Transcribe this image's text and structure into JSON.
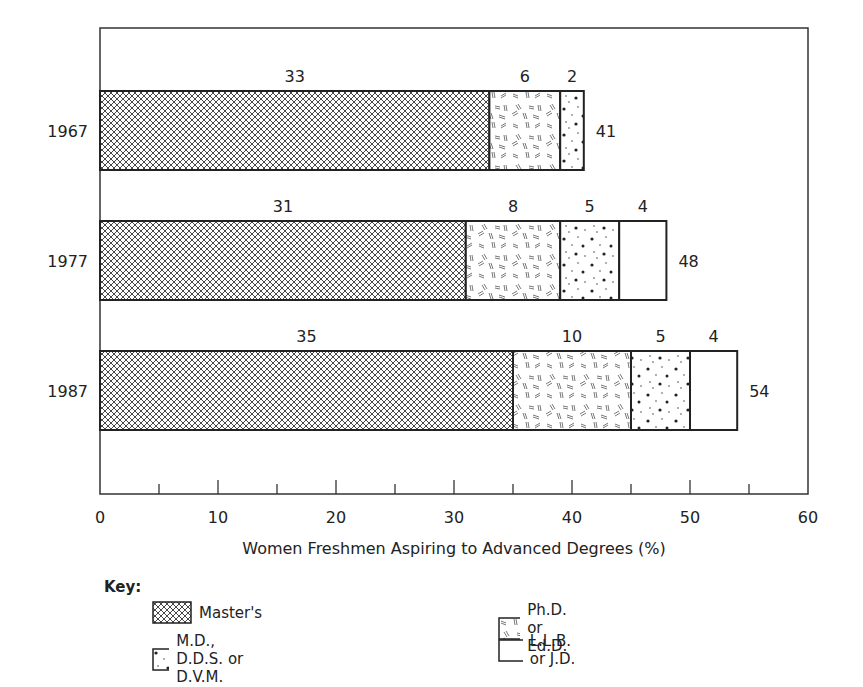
{
  "chart_data": {
    "type": "bar",
    "orientation": "horizontal",
    "stacked": true,
    "title": "",
    "xlabel": "Women Freshmen Aspiring to Advanced Degrees (%)",
    "ylabel": "",
    "xlim": [
      0,
      60
    ],
    "x_ticks": [
      0,
      10,
      20,
      30,
      40,
      50,
      60
    ],
    "x_minor_ticks": [
      5,
      15,
      25,
      35,
      45,
      55
    ],
    "grid": false,
    "categories": [
      "1967",
      "1977",
      "1987"
    ],
    "series": [
      {
        "name": "Master's",
        "pattern": "crosshatch",
        "values": [
          33,
          31,
          35
        ]
      },
      {
        "name": "Ph.D. or Ed.D.",
        "pattern": "dashes",
        "values": [
          6,
          8,
          10
        ]
      },
      {
        "name": "M.D., D.D.S. or D.V.M.",
        "pattern": "dots",
        "values": [
          2,
          5,
          5
        ]
      },
      {
        "name": "L.L.B. or J.D.",
        "pattern": "blank",
        "values": [
          0,
          4,
          4
        ]
      }
    ],
    "totals": [
      41,
      48,
      54
    ],
    "legend_position": "bottom",
    "legend_title": "Key:"
  },
  "legend": {
    "title": "Key:",
    "items": [
      {
        "label": "Master's",
        "pattern": "crosshatch"
      },
      {
        "label": "M.D., D.D.S. or D.V.M.",
        "pattern": "dots"
      },
      {
        "label": "Ph.D. or Ed.D.",
        "pattern": "dashes"
      },
      {
        "label": "L.L.B. or J.D.",
        "pattern": "blank"
      }
    ]
  },
  "colors": {
    "ink": "#222222",
    "background": "#ffffff"
  }
}
